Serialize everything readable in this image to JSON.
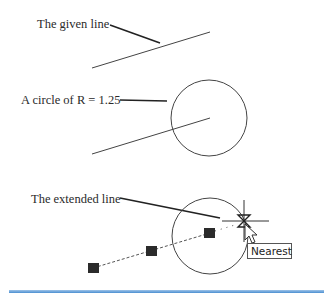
{
  "labels": {
    "given_line": "The given line",
    "circle": "A circle of R = 1.25",
    "extended_line": "The extended line"
  },
  "tooltip": {
    "text": "Nearest"
  },
  "figures": [
    {
      "id": "step-1",
      "description": "Given line segment"
    },
    {
      "id": "step-2",
      "description": "Line with circle of radius 1.25"
    },
    {
      "id": "step-3",
      "description": "Line extended to circle using Nearest osnap"
    }
  ],
  "circle_radius": "1.25",
  "colors": {
    "line": "#3a3a3a",
    "grip": "#2b2b2b",
    "rule": "#4b8fd1"
  }
}
